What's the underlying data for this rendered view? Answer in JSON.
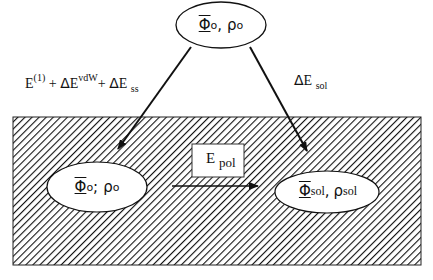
{
  "diagram": {
    "top_node": {
      "phi": "Φ",
      "phi_sup": "o",
      "sep": ",",
      "rho": "ρ",
      "rho_sup": "o"
    },
    "left_node": {
      "phi": "Φ",
      "phi_sup": "o",
      "sep": ";",
      "rho": "ρ",
      "rho_sup": "o"
    },
    "right_node": {
      "phi": "Φ",
      "phi_sub": "sol",
      "sep": ",",
      "rho": "ρ",
      "rho_sub": "sol"
    },
    "left_arrow_label": {
      "e": "E",
      "e_sup": "(1)",
      "plus1": "+ ",
      "delta1": "Δ",
      "e2": "E",
      "e2_sup": "vdW",
      "plus2": "+ ",
      "delta2": "Δ",
      "e3": "E",
      "e3_sub": "ss"
    },
    "right_arrow_label": {
      "delta": "Δ",
      "e": "E",
      "e_sub": "sol"
    },
    "pol_box": {
      "e": "E",
      "e_sub": "pol"
    },
    "colors": {
      "line": "#111111",
      "hatch": "#111111",
      "background": "#ffffff"
    }
  }
}
